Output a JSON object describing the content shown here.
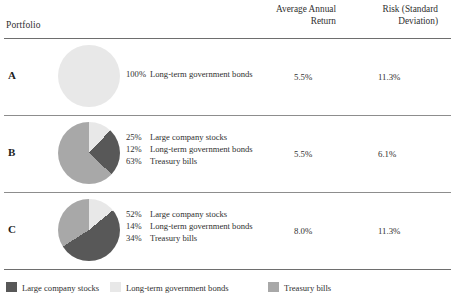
{
  "header": {
    "portfolio_label": "Portfolio",
    "col_return": "Average Annual Return",
    "col_return_line1": "Average Annual",
    "col_return_line2": "Return",
    "col_risk": "Risk (Standard Deviation)",
    "col_risk_line1": "Risk (Standard",
    "col_risk_line2": "Deviation)"
  },
  "colors": {
    "stocks": "#585858",
    "bonds": "#e8e8e8",
    "tbills": "#a8a8a8",
    "rule": "#6e6e6e",
    "text": "#2f2f2f"
  },
  "rows": [
    {
      "letter": "A",
      "composition": [
        {
          "pct": "100%",
          "name": "Long-term government bonds"
        }
      ],
      "return": "5.5%",
      "risk": "11.3%"
    },
    {
      "letter": "B",
      "composition": [
        {
          "pct": "25%",
          "name": "Large company stocks"
        },
        {
          "pct": "12%",
          "name": "Long-term government bonds"
        },
        {
          "pct": "63%",
          "name": "Treasury bills"
        }
      ],
      "return": "5.5%",
      "risk": "6.1%"
    },
    {
      "letter": "C",
      "composition": [
        {
          "pct": "52%",
          "name": "Large company stocks"
        },
        {
          "pct": "14%",
          "name": "Long-term government bonds"
        },
        {
          "pct": "34%",
          "name": "Treasury bills"
        }
      ],
      "return": "8.0%",
      "risk": "11.3%"
    }
  ],
  "legend": [
    {
      "label": "Large company stocks",
      "color": "#585858"
    },
    {
      "label": "Long-term government bonds",
      "color": "#e8e8e8"
    },
    {
      "label": "Treasury bills",
      "color": "#a8a8a8"
    }
  ],
  "chart_data": {
    "type": "pie",
    "legend_position": "bottom",
    "series_names": [
      "Large company stocks",
      "Long-term government bonds",
      "Treasury bills"
    ],
    "series_colors": [
      "#585858",
      "#e8e8e8",
      "#a8a8a8"
    ],
    "charts": [
      {
        "portfolio": "A",
        "categories": [
          "Long-term government bonds"
        ],
        "values": [
          100
        ],
        "average_annual_return_pct": 5.5,
        "risk_std_dev_pct": 11.3
      },
      {
        "portfolio": "B",
        "categories": [
          "Large company stocks",
          "Long-term government bonds",
          "Treasury bills"
        ],
        "values": [
          25,
          12,
          63
        ],
        "average_annual_return_pct": 5.5,
        "risk_std_dev_pct": 6.1
      },
      {
        "portfolio": "C",
        "categories": [
          "Large company stocks",
          "Long-term government bonds",
          "Treasury bills"
        ],
        "values": [
          52,
          14,
          34
        ],
        "average_annual_return_pct": 8.0,
        "risk_std_dev_pct": 11.3
      }
    ]
  }
}
